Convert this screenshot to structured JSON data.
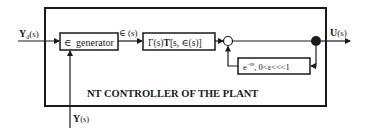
{
  "diagram": {
    "title": "NT CONTROLLER OF THE PLANT",
    "inputs": {
      "reference": {
        "label": "Y",
        "subscript": "d",
        "arg": "(s)"
      },
      "feedback": {
        "label": "Y",
        "arg": "(s)"
      }
    },
    "output": {
      "label": "U",
      "arg": "(s)"
    },
    "blocks": {
      "epsilon_generator": {
        "label_symbol": "∈",
        "label_text": "generator"
      },
      "controller": {
        "label": "Γ(s)T[s, ∈(s)]",
        "gamma": "Γ(s)",
        "t": "T",
        "args": "[s, ∈(s)]"
      },
      "delay": {
        "label": "e⁻ᵉˢ, 0<ε<<<1",
        "exp_base": "e",
        "exp_sup": "−εs",
        "condition": ", 0<ε<<<1"
      }
    },
    "signals": {
      "epsilon": "∈ (s)"
    },
    "colors": {
      "line": "#1a1a1a",
      "background": "#ffffff"
    }
  }
}
